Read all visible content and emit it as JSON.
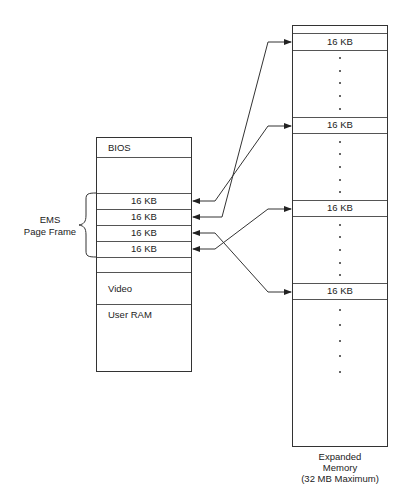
{
  "diagram": {
    "conventional_memory": {
      "blocks": {
        "bios": "BIOS",
        "page_slots": [
          "16 KB",
          "16 KB",
          "16 KB",
          "16 KB"
        ],
        "video": "Video",
        "user_ram": "User RAM"
      },
      "page_frame_label_line1": "EMS",
      "page_frame_label_line2": "Page Frame"
    },
    "expanded_memory": {
      "pages": [
        "16 KB",
        "16 KB",
        "16 KB",
        "16 KB"
      ],
      "caption_line1": "Expanded",
      "caption_line2": "Memory",
      "caption_line3": "(32 MB Maximum)"
    },
    "mappings": [
      {
        "from_expanded_page": 1,
        "to_page_slot": 2
      },
      {
        "from_expanded_page": 2,
        "to_page_slot": 1
      },
      {
        "from_expanded_page": 3,
        "to_page_slot": 4
      },
      {
        "from_expanded_page": 4,
        "to_page_slot": 3
      }
    ]
  }
}
